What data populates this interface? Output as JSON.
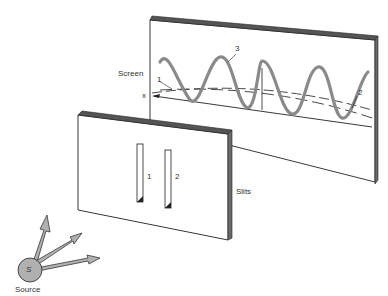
{
  "diagram": {
    "labels": {
      "screen": "Screen",
      "slits": "Slits",
      "source": "Source",
      "source_symbol": "S",
      "x_axis": "x",
      "curve_1": "1",
      "curve_2": "2",
      "curve_3": "3",
      "slit_1": "1",
      "slit_2": "2"
    },
    "colors": {
      "line": "#222222",
      "wave": "#8a8a8a",
      "source_fill": "#b0b0b0",
      "edge_shade": "#6a6a6a",
      "background": "#ffffff"
    }
  }
}
